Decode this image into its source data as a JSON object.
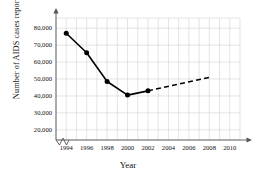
{
  "chart_data": {
    "type": "line",
    "title": "",
    "xlabel": "Year",
    "ylabel": "Number of AIDS cases reported",
    "xlim": [
      1993,
      2011
    ],
    "ylim": [
      14000,
      86000
    ],
    "grid": true,
    "legend": "none",
    "x_ticks": [
      "1994",
      "1996",
      "1998",
      "2000",
      "2002",
      "2004",
      "2006",
      "2008",
      "2010"
    ],
    "x_tick_values": [
      1994,
      1996,
      1998,
      2000,
      2002,
      2004,
      2006,
      2008,
      2010
    ],
    "y_ticks": [
      "20,000",
      "30,000",
      "40,000",
      "50,000",
      "60,000",
      "70,000",
      "80,000"
    ],
    "y_tick_values": [
      20000,
      30000,
      40000,
      50000,
      60000,
      70000,
      80000
    ],
    "axis_break_x": true,
    "series": [
      {
        "name": "Reported AIDS cases",
        "style": "solid",
        "marker": "filled-circle",
        "x": [
          1994,
          1996,
          1998,
          2000,
          2002
        ],
        "values": [
          77000,
          65500,
          48500,
          40500,
          43000
        ]
      },
      {
        "name": "Projected trend",
        "style": "dashed",
        "marker": "none",
        "x": [
          2002,
          2008
        ],
        "values": [
          43000,
          51000
        ]
      }
    ]
  },
  "colors": {
    "line": "#000000",
    "marker": "#000000",
    "grid": "#d8d8dc",
    "axis": "#555555",
    "text": "#111111",
    "background": "#ffffff"
  }
}
